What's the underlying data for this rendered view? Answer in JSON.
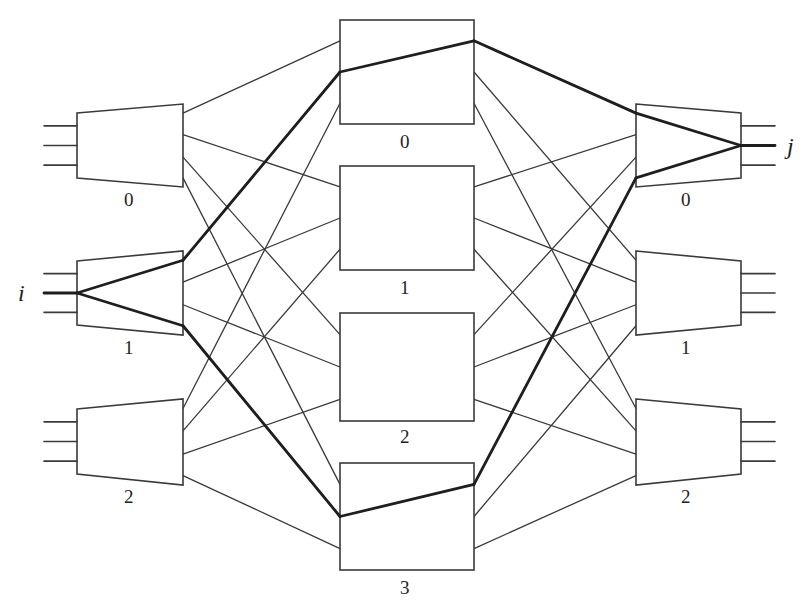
{
  "diagram": {
    "type": "three-stage Clos switching network",
    "colors": {
      "line": "#3a3a3a",
      "bold_path": "#1e1e1e",
      "background": "#ffffff"
    },
    "endpoints": {
      "input_label": "i",
      "output_label": "j"
    },
    "ingress": [
      {
        "id": "L0",
        "label": "0",
        "ports_in": 3,
        "ports_out": 4
      },
      {
        "id": "L1",
        "label": "1",
        "ports_in": 3,
        "ports_out": 4
      },
      {
        "id": "L2",
        "label": "2",
        "ports_in": 3,
        "ports_out": 4
      }
    ],
    "middle": [
      {
        "id": "M0",
        "label": "0",
        "ports_in": 3,
        "ports_out": 3
      },
      {
        "id": "M1",
        "label": "1",
        "ports_in": 3,
        "ports_out": 3
      },
      {
        "id": "M2",
        "label": "2",
        "ports_in": 3,
        "ports_out": 3
      },
      {
        "id": "M3",
        "label": "3",
        "ports_in": 3,
        "ports_out": 3
      }
    ],
    "egress": [
      {
        "id": "R0",
        "label": "0",
        "ports_in": 4,
        "ports_out": 3
      },
      {
        "id": "R1",
        "label": "1",
        "ports_in": 4,
        "ports_out": 3
      },
      {
        "id": "R2",
        "label": "2",
        "ports_in": 4,
        "ports_out": 3
      }
    ],
    "highlighted_paths": [
      [
        "i",
        "L1",
        "M0",
        "R0",
        "j"
      ],
      [
        "i",
        "L1",
        "M3",
        "R0",
        "j"
      ]
    ]
  }
}
